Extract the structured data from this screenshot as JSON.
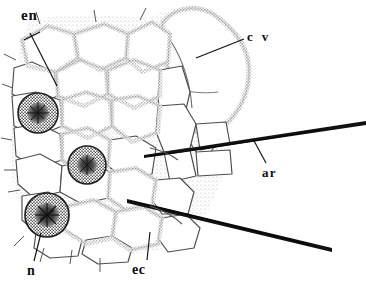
{
  "figure": {
    "kind": "scientific-line-drawing",
    "background_color": "#ffffff",
    "ink_color": "#2b2b2b",
    "label_color": "#0d0d0d",
    "width": 366,
    "height": 290
  },
  "labels": [
    {
      "id": "en",
      "text": "en",
      "meaning": "endocuticle / endothecium layer",
      "x": 21,
      "y": 8,
      "leader": {
        "x1": 30,
        "y1": 33,
        "x2": 57,
        "y2": 86
      }
    },
    {
      "id": "cv",
      "text": "c v",
      "meaning": "clear vesicle",
      "x": 247,
      "y": 30,
      "leader": {
        "x1": 244,
        "y1": 39,
        "x2": 196,
        "y2": 58
      }
    },
    {
      "id": "ar",
      "text": "ar",
      "meaning": "arista / bristle",
      "x": 262,
      "y": 166,
      "leader": {
        "x1": 266,
        "y1": 163,
        "x2": 253,
        "y2": 139
      }
    },
    {
      "id": "n",
      "text": "n",
      "meaning": "nucleus",
      "x": 27,
      "y": 264,
      "leader": {
        "x1": 34,
        "y1": 261,
        "x2": 41,
        "y2": 233
      }
    },
    {
      "id": "ec",
      "text": "ec",
      "meaning": "epidermal cell",
      "x": 132,
      "y": 263,
      "leader": {
        "x1": 147,
        "y1": 260,
        "x2": 150,
        "y2": 232
      }
    }
  ],
  "nuclei": [
    {
      "id": "nucleus-upper-left",
      "cx": 38,
      "cy": 113,
      "r": 20
    },
    {
      "id": "nucleus-middle",
      "cx": 87,
      "cy": 165,
      "r": 19
    },
    {
      "id": "nucleus-lower-left",
      "cx": 47,
      "cy": 215,
      "r": 22
    }
  ],
  "bristles": [
    {
      "id": "bristle-upper",
      "x1": 144,
      "y1": 153,
      "x2": 366,
      "y2": 123
    },
    {
      "id": "bristle-lower",
      "x1": 128,
      "y1": 201,
      "x2": 332,
      "y2": 251
    }
  ],
  "vesicle": {
    "id": "clear-vesicle",
    "cx": 205,
    "cy": 62,
    "rx": 45,
    "ry": 52
  }
}
